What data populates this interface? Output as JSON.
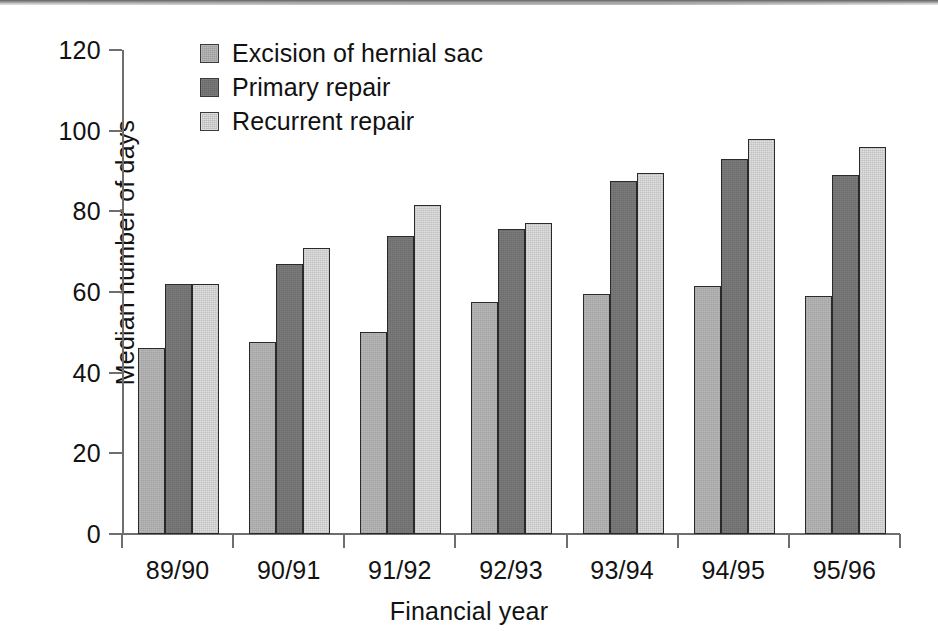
{
  "chart_data": {
    "type": "bar",
    "title": "",
    "subtitle": "",
    "xlabel": "Financial year",
    "ylabel": "Median number of days",
    "categories": [
      "89/90",
      "90/91",
      "91/92",
      "92/93",
      "93/94",
      "94/95",
      "95/96"
    ],
    "series": [
      {
        "name": "Excision of hernial sac",
        "color": "#b9b9b9",
        "values": [
          46,
          47.5,
          50,
          57.5,
          59.5,
          61.5,
          59
        ]
      },
      {
        "name": "Primary repair",
        "color": "#7c7c7c",
        "values": [
          62,
          67,
          74,
          75.5,
          87.5,
          93,
          89
        ]
      },
      {
        "name": "Recurrent repair",
        "color": "#dedede",
        "values": [
          62,
          71,
          81.5,
          77,
          89.5,
          98,
          96
        ]
      }
    ],
    "ylim": [
      0,
      120
    ],
    "ytick_values": [
      0,
      20,
      40,
      60,
      80,
      100,
      120
    ],
    "ytick_labels": [
      "0",
      "20",
      "40",
      "60",
      "80",
      "100",
      "120"
    ],
    "grid": false,
    "legend_position": "top-left-inside",
    "axis_color": "#6e6e6e",
    "bar_edge_color": "#2a2a2a",
    "text_color": "#121212",
    "background": "#ffffff"
  },
  "legend": {
    "items": [
      {
        "label": "Excision of hernial sac",
        "swatch": "series-0-swatch"
      },
      {
        "label": "Primary repair",
        "swatch": "series-1-swatch"
      },
      {
        "label": "Recurrent repair",
        "swatch": "series-2-swatch"
      }
    ]
  }
}
